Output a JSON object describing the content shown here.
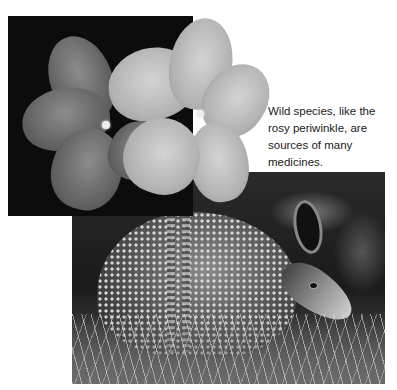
{
  "caption": {
    "text": "Wild species, like the rosy periwinkle, are sources of many medicines."
  },
  "images": [
    {
      "subject": "rosy periwinkle flowers with water droplets",
      "style": "grayscale photo"
    },
    {
      "subject": "nine-banded armadillo in grass",
      "style": "grayscale photo"
    }
  ],
  "colors": {
    "background": "#ffffff",
    "text": "#1a1a1a"
  }
}
